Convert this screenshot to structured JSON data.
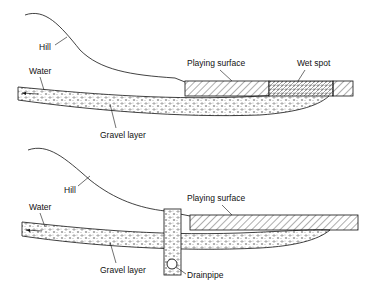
{
  "diagrams": [
    {
      "id": "top",
      "labels": {
        "hill": "Hill",
        "water": "Water",
        "playing_surface": "Playing surface",
        "wet_spot": "Wet spot",
        "gravel_layer": "Gravel layer"
      }
    },
    {
      "id": "bottom",
      "labels": {
        "hill": "Hill",
        "water": "Water",
        "playing_surface": "Playing surface",
        "gravel_layer": "Gravel layer",
        "drainpipe": "Drainpipe"
      }
    }
  ],
  "colors": {
    "line": "#111111",
    "background": "#ffffff"
  }
}
